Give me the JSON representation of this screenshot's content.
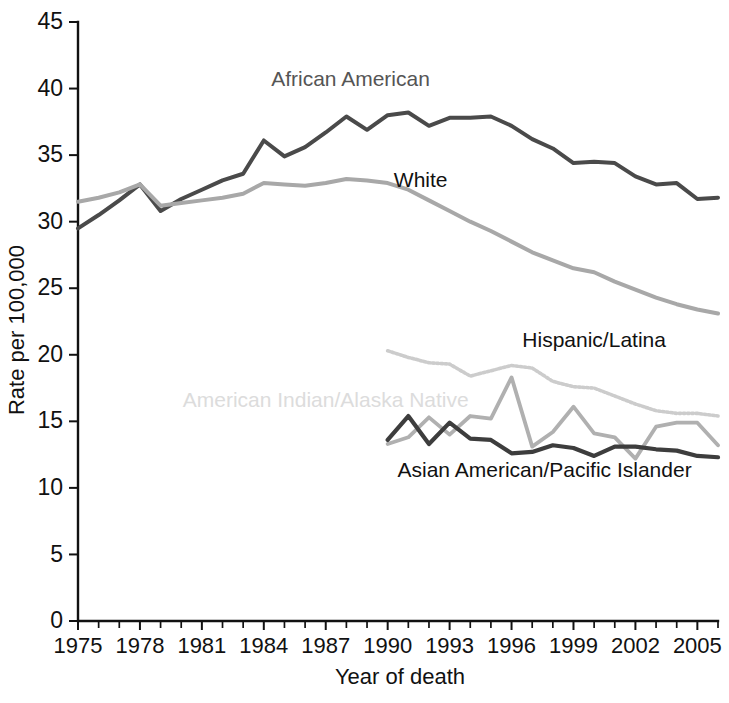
{
  "chart_data": {
    "type": "line",
    "title": "",
    "xlabel": "Year of death",
    "ylabel": "Rate per 100,000",
    "xlim": [
      1975,
      2006
    ],
    "ylim": [
      0,
      45
    ],
    "ytick_labels": [
      "0",
      "5",
      "10",
      "15",
      "20",
      "25",
      "30",
      "35",
      "40",
      "45"
    ],
    "ytick_values": [
      0,
      5,
      10,
      15,
      20,
      25,
      30,
      35,
      40,
      45
    ],
    "xtick_labels": [
      "1975",
      "1978",
      "1981",
      "1984",
      "1987",
      "1990",
      "1993",
      "1996",
      "1999",
      "2002",
      "2005"
    ],
    "xtick_values": [
      1975,
      1978,
      1981,
      1984,
      1987,
      1990,
      1993,
      1996,
      1999,
      2002,
      2005
    ],
    "xtick_minor_step": 1,
    "grid": false,
    "legend": "inline-labels",
    "series": [
      {
        "name": "African American",
        "color": "#4a4a4a",
        "label_color": "#555555",
        "width": 4.0,
        "dash": "none",
        "label_x": 1988.2,
        "label_y": 40.2,
        "x": [
          1975,
          1976,
          1977,
          1978,
          1979,
          1980,
          1981,
          1982,
          1983,
          1984,
          1985,
          1986,
          1987,
          1988,
          1989,
          1990,
          1991,
          1992,
          1993,
          1994,
          1995,
          1996,
          1997,
          1998,
          1999,
          2000,
          2001,
          2002,
          2003,
          2004,
          2005,
          2006
        ],
        "y": [
          29.5,
          30.5,
          31.6,
          32.8,
          30.8,
          31.7,
          32.4,
          33.1,
          33.6,
          36.1,
          34.9,
          35.6,
          36.7,
          37.9,
          36.9,
          38.0,
          38.2,
          37.2,
          37.8,
          37.8,
          37.9,
          37.2,
          36.2,
          35.5,
          34.4,
          34.5,
          34.4,
          33.4,
          32.8,
          32.9,
          31.7,
          31.8
        ]
      },
      {
        "name": "White",
        "color": "#a8a8a8",
        "label_color": "#111111",
        "width": 4.0,
        "dash": "none",
        "label_x": 1991.6,
        "label_y": 32.6,
        "x": [
          1975,
          1976,
          1977,
          1978,
          1979,
          1980,
          1981,
          1982,
          1983,
          1984,
          1985,
          1986,
          1987,
          1988,
          1989,
          1990,
          1991,
          1992,
          1993,
          1994,
          1995,
          1996,
          1997,
          1998,
          1999,
          2000,
          2001,
          2002,
          2003,
          2004,
          2005,
          2006
        ],
        "y": [
          31.5,
          31.8,
          32.2,
          32.8,
          31.2,
          31.4,
          31.6,
          31.8,
          32.1,
          32.9,
          32.8,
          32.7,
          32.9,
          33.2,
          33.1,
          32.9,
          32.4,
          31.6,
          30.8,
          30.0,
          29.3,
          28.5,
          27.7,
          27.1,
          26.5,
          26.2,
          25.5,
          24.9,
          24.3,
          23.8,
          23.4,
          23.1
        ]
      },
      {
        "name": "Hispanic/Latina",
        "color": "#cccccc",
        "label_color": "#111111",
        "width": 3.6,
        "dash": "2 2.2",
        "label_x": 2000.0,
        "label_y": 20.6,
        "x": [
          1990,
          1991,
          1992,
          1993,
          1994,
          1995,
          1996,
          1997,
          1998,
          1999,
          2000,
          2001,
          2002,
          2003,
          2004,
          2005,
          2006
        ],
        "y": [
          20.3,
          19.8,
          19.4,
          19.3,
          18.4,
          18.8,
          19.2,
          19.0,
          18.0,
          17.6,
          17.5,
          16.9,
          16.3,
          15.8,
          15.6,
          15.6,
          15.4
        ]
      },
      {
        "name": "American Indian/Alaska Native",
        "color": "#b0b0b0",
        "label_color": "#dcdcdc",
        "width": 3.8,
        "dash": "none",
        "label_x": 1987.0,
        "label_y": 16.1,
        "x": [
          1990,
          1991,
          1992,
          1993,
          1994,
          1995,
          1996,
          1997,
          1998,
          1999,
          2000,
          2001,
          2002,
          2003,
          2004,
          2005,
          2006
        ],
        "y": [
          13.3,
          13.8,
          15.3,
          14.0,
          15.4,
          15.2,
          18.3,
          13.1,
          14.2,
          16.1,
          14.1,
          13.8,
          12.2,
          14.6,
          14.9,
          14.9,
          13.2
        ]
      },
      {
        "name": "Asian American/Pacific Islander",
        "color": "#3d3d3d",
        "label_color": "#111111",
        "width": 4.2,
        "dash": "none",
        "label_x": 1997.6,
        "label_y": 10.8,
        "x": [
          1990,
          1991,
          1992,
          1993,
          1994,
          1995,
          1996,
          1997,
          1998,
          1999,
          2000,
          2001,
          2002,
          2003,
          2004,
          2005,
          2006
        ],
        "y": [
          13.6,
          15.4,
          13.3,
          14.9,
          13.7,
          13.6,
          12.6,
          12.7,
          13.2,
          13.0,
          12.4,
          13.1,
          13.1,
          12.9,
          12.8,
          12.4,
          12.3
        ]
      }
    ]
  }
}
